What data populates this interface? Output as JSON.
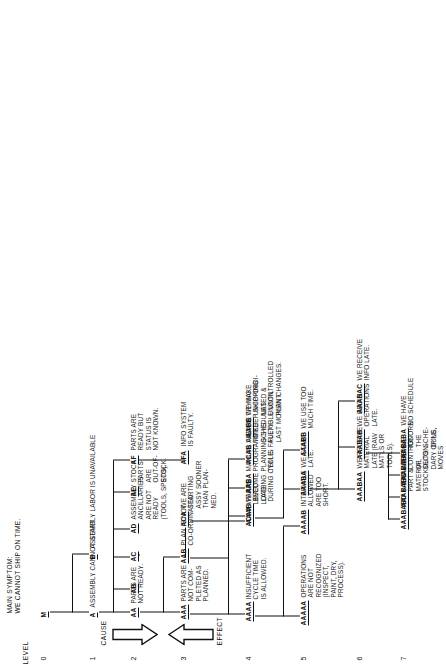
{
  "diagram": {
    "title_lines": "MAIN SYMPTOM:\nWE CANNOT SHIP ON TIME.",
    "level_word": "LEVEL",
    "levels": [
      "0",
      "1",
      "2",
      "3",
      "4",
      "5",
      "6",
      "7"
    ],
    "cause_label": "CAUSE",
    "effect_label": "EFFECT"
  },
  "nodes": {
    "M": {
      "code": "M",
      "text": ""
    },
    "A": {
      "code": "A",
      "text": "ASSEMBLY CANNOT START"
    },
    "B": {
      "code": "B",
      "text": "ASSEMBLY LABOR IS UNAVAILABLE"
    },
    "AA": {
      "code": "AA",
      "text": "PARTS ARE\nNOT READY."
    },
    "AB": {
      "code": "AB",
      "text": ""
    },
    "AC": {
      "code": "AC",
      "text": ""
    },
    "AD": {
      "code": "AD",
      "text": ""
    },
    "AE": {
      "code": "AE",
      "text": "STOCK\nPARTS\nARE\nOUT-OF-\nSTOCK."
    },
    "AF": {
      "code": "AF",
      "text": "PARTS ARE\nREADY BUT\nSTATUS IS\nNOT KNOWN."
    },
    "AAA": {
      "code": "AAA",
      "text": "PARTS ARE\nNOT COM-\nPLETED AS\nPLANNED."
    },
    "AAB": {
      "code": "AAB",
      "text": "PLAN IS NOT\nCO-ORDINATED."
    },
    "ACA": {
      "code": "ACA",
      "text": "WE ARE\nSTARTING\nASSY SOONER\nTHAN PLAN-\nNED."
    },
    "ADx": {
      "code": "AD",
      "text": "ASSEMBLY\nANCILLARIES\nARE NOT\nREADY\n(TOOLS, SPECS)."
    },
    "AFA": {
      "code": "AFA",
      "text": "INFO SYSTEM\nIS FAULTY."
    },
    "AAAA": {
      "code": "AAAA",
      "text": "INSUFFICIENT\nCYCLE TIME\nIS ALLOWED."
    },
    "AAAB": {
      "code": "AAAB",
      "text": "PARTS\nBECOME\nLATE\nDURING CYCLE."
    },
    "AABA": {
      "code": "AABA",
      "text": "MANUAL AND\nPROGRAMMED\nPLANNING SYS-\nTEM IS FAULTY."
    },
    "AABB": {
      "code": "AABB",
      "text": "WE MAKE\nUNCO-ORDI-\nNATED &\nUNCONTROLLED\nPLAN CHANGES."
    },
    "ACAA": {
      "code": "ACAA",
      "text": "WE ARE\nLEVEL\nLOADING."
    },
    "ACAB": {
      "code": "ACAB",
      "text": "WE ARE TRYING\nTO KEEP SHIPPING\nSCHEDULES\nFLEXIBLE UNTIL\nLAST MOMENT."
    },
    "AAAAA": {
      "code": "AAAAA",
      "text": "OPERATIONS\nARE NOT\nRECOGNIZED\n(INSPECT,\nPAINT, DRY,\nPROCESS)."
    },
    "AAAAB": {
      "code": "AAAAB",
      "text": "INTERVALS\nALLOWED\nARE TOO\nSHORT."
    },
    "AAABA": {
      "code": "AAABA",
      "text": "WE START\nLATE."
    },
    "AAABB": {
      "code": "AAABB",
      "text": "WE USE TOO\nMUCH TIME."
    },
    "AAABAA": {
      "code": "AAABAA",
      "text": "WE RECEIVE\nMATERIAL\nLATE (RAW\nMAT'LS OR\nTOOLS)."
    },
    "AAABAB": {
      "code": "AAABAB",
      "text": "WE BEGIN\nOPERATIONS\nLATE."
    },
    "AAABAC": {
      "code": "AAABAC",
      "text": "WE RECEIVE\nINFO LATE."
    },
    "AAABABA": {
      "code": "AAABABA",
      "text": "WE HAVE\nNO SCHEDULE"
    },
    "AAABABB": {
      "code": "AAABABB",
      "text": "WE\nIGNORE\nTHE\nSCHE-\nDULE."
    },
    "AAABABC": {
      "code": "AAABABC",
      "text": "WE LOSE\nCONTROL\nOF\nSECON-\nDARY OP'NS,\nMOVES"
    },
    "AAABABD": {
      "code": "AAABABD",
      "text": "WE HAVE\nPART &\nMATERIAL\nSTOCKOUTS"
    }
  },
  "colors": {
    "ink": "#111111",
    "paper": "#ffffff"
  }
}
